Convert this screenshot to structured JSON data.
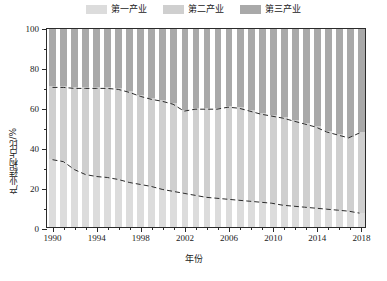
{
  "chart_data": {
    "type": "bar",
    "stacked": true,
    "normalized_percent": true,
    "title": "",
    "xlabel": "年份",
    "ylabel": "产业结构占比/%",
    "ylim": [
      0,
      100
    ],
    "yticks": [
      0,
      20,
      40,
      60,
      80,
      100
    ],
    "yticks_minor": [
      10,
      30,
      50,
      70,
      90
    ],
    "grid": false,
    "legend_position": "top-center",
    "categories": [
      1990,
      1991,
      1992,
      1993,
      1994,
      1995,
      1996,
      1997,
      1998,
      1999,
      2000,
      2001,
      2002,
      2003,
      2004,
      2005,
      2006,
      2007,
      2008,
      2009,
      2010,
      2011,
      2012,
      2013,
      2014,
      2015,
      2016,
      2017,
      2018
    ],
    "xtick_labels": [
      "1990",
      "1994",
      "1998",
      "2002",
      "2006",
      "2010",
      "2014",
      "2018"
    ],
    "xtick_values": [
      1990,
      1994,
      1998,
      2002,
      2006,
      2010,
      2014,
      2018
    ],
    "series": [
      {
        "name": "第一产业",
        "color": "#dcdcdc",
        "values": [
          34.0,
          33.0,
          29.0,
          26.5,
          25.5,
          25.0,
          24.0,
          22.5,
          21.5,
          20.5,
          19.0,
          18.0,
          17.0,
          16.0,
          15.0,
          14.5,
          14.0,
          13.5,
          13.0,
          12.5,
          12.0,
          11.0,
          10.5,
          10.0,
          9.5,
          9.0,
          8.5,
          8.0,
          7.0
        ]
      },
      {
        "name": "第二产业",
        "color": "#cfcfcf",
        "values": [
          36.5,
          37.5,
          41.0,
          43.5,
          44.5,
          45.0,
          45.5,
          45.5,
          44.5,
          44.0,
          44.5,
          44.0,
          41.5,
          43.5,
          44.5,
          45.0,
          46.5,
          46.5,
          45.5,
          44.5,
          44.0,
          44.0,
          43.0,
          42.0,
          41.0,
          39.0,
          38.0,
          37.0,
          40.5
        ]
      },
      {
        "name": "第三产业",
        "color": "#a9a9a9",
        "values": [
          29.5,
          29.5,
          30.0,
          30.0,
          30.0,
          30.0,
          30.5,
          32.0,
          34.0,
          35.5,
          36.5,
          38.0,
          41.5,
          40.5,
          40.5,
          40.5,
          39.5,
          40.0,
          41.5,
          43.0,
          44.0,
          45.0,
          46.5,
          48.0,
          49.5,
          52.0,
          53.5,
          55.0,
          52.5
        ]
      }
    ],
    "boundary_lines": [
      {
        "name": "第一产业累计上界",
        "style": "dashed",
        "color": "#2b2b2b",
        "values": [
          34.0,
          33.0,
          29.0,
          26.5,
          25.5,
          25.0,
          24.0,
          22.5,
          21.5,
          20.5,
          19.0,
          18.0,
          17.0,
          16.0,
          15.0,
          14.5,
          14.0,
          13.5,
          13.0,
          12.5,
          12.0,
          11.0,
          10.5,
          10.0,
          9.5,
          9.0,
          8.5,
          8.0,
          7.0
        ]
      },
      {
        "name": "第二产业累计上界",
        "style": "dashed",
        "color": "#2b2b2b",
        "values": [
          70.5,
          70.5,
          70.0,
          70.0,
          70.0,
          70.0,
          69.5,
          68.0,
          66.0,
          64.5,
          63.5,
          62.0,
          58.5,
          59.5,
          59.5,
          59.5,
          60.5,
          60.0,
          58.5,
          57.0,
          56.0,
          55.0,
          53.5,
          52.0,
          50.5,
          48.0,
          46.5,
          45.0,
          47.5
        ]
      }
    ]
  },
  "legend": {
    "items": [
      {
        "label": "第一产业",
        "color": "#dcdcdc"
      },
      {
        "label": "第二产业",
        "color": "#cfcfcf"
      },
      {
        "label": "第三产业",
        "color": "#a9a9a9"
      }
    ]
  },
  "axes": {
    "y_title": "产业结构占比/%",
    "x_title": "年份"
  }
}
